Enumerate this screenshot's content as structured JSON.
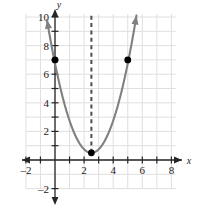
{
  "chart_data": {
    "type": "line",
    "title": "",
    "xlabel": "x",
    "ylabel": "y",
    "xlim": [
      -2.3,
      8.3
    ],
    "ylim": [
      -2.3,
      10.5
    ],
    "grid": true,
    "grid_step": 1,
    "legend": "none",
    "x_ticks": [
      -2,
      2,
      4,
      6,
      8
    ],
    "x_tick_labels": [
      "–2",
      "2",
      "4",
      "6",
      "8"
    ],
    "x_minor_ticks": [
      -1,
      1,
      3,
      5,
      7
    ],
    "y_ticks": [
      -2,
      2,
      4,
      6,
      8,
      10
    ],
    "y_tick_labels": [
      "–2",
      "2",
      "4",
      "6",
      "8",
      "10"
    ],
    "y_minor_ticks": [
      1,
      3,
      5,
      7,
      9
    ],
    "curve": {
      "name": "parabola",
      "equation": "y = (x - 2.5)^2 + 0.5",
      "vertex": [
        2.5,
        0.5
      ],
      "leading_coefficient": 1,
      "color": "#808080",
      "x_start": -0.55,
      "x_end": 5.6,
      "arrow_start": true,
      "arrow_end": true
    },
    "axis_of_symmetry": {
      "x": 2.5,
      "style": "dashed",
      "color": "#4d4d4d",
      "y_from": 0.5,
      "y_to": 10.2
    },
    "points": [
      {
        "label": "(0, 7)",
        "x": 0,
        "y": 7,
        "color": "#000000"
      },
      {
        "label": "(2.5, 0.5)",
        "x": 2.5,
        "y": 0.5,
        "color": "#000000"
      },
      {
        "label": "(5, 7)",
        "x": 5,
        "y": 7,
        "color": "#000000"
      }
    ],
    "colors": {
      "grid": "#e2dede",
      "axis": "#262626",
      "curve": "#808080",
      "dashed": "#4d4d4d",
      "point": "#000000",
      "background": "#ffffff"
    }
  },
  "axis_labels": {
    "x": "x",
    "y": "y"
  }
}
